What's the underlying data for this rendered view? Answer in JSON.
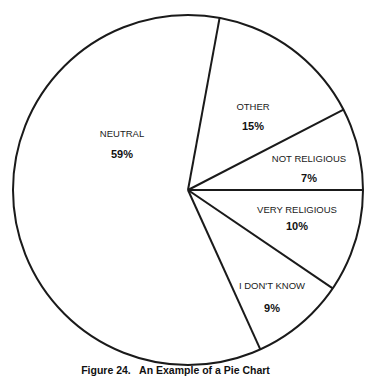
{
  "chart_data": {
    "type": "pie",
    "title": "Figure 24.   An Example of a Pie Chart",
    "categories": [
      "NEUTRAL",
      "OTHER",
      "NOT RELIGIOUS",
      "VERY RELIGIOUS",
      "I DON'T KNOW"
    ],
    "values": [
      59,
      15,
      7,
      10,
      9
    ],
    "value_labels": [
      "59%",
      "15%",
      "7%",
      "10%",
      "9%"
    ],
    "legend": "none (labels inside slices)",
    "fill_color": "#ffffff",
    "stroke_color": "#1a1a1a"
  },
  "geometry": {
    "cx": 188,
    "cy": 190,
    "r": 175,
    "boundary_angles_deg": [
      -79.6,
      -27.3,
      0,
      34.2,
      65.6
    ]
  },
  "labels": [
    {
      "name": "NEUTRAL",
      "value": "59%",
      "x": 122,
      "y": 137,
      "vy": 158
    },
    {
      "name": "OTHER",
      "value": "15%",
      "x": 253,
      "y": 110,
      "vy": 130
    },
    {
      "name": "NOT RELIGIOUS",
      "value": "7%",
      "x": 309,
      "y": 162,
      "vy": 182
    },
    {
      "name": "VERY RELIGIOUS",
      "value": "10%",
      "x": 297,
      "y": 213,
      "vy": 230
    },
    {
      "name": "I DON'T KNOW",
      "value": "9%",
      "x": 272,
      "y": 289,
      "vy": 312
    }
  ],
  "caption": "Figure 24.   An Example of a Pie Chart"
}
